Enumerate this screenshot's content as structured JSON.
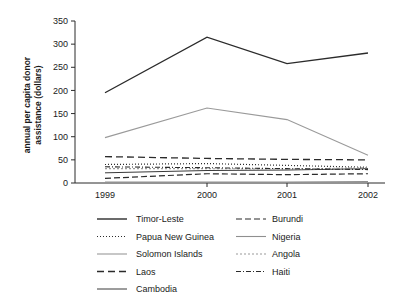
{
  "chart_data": {
    "type": "line",
    "title": "",
    "xlabel": "",
    "ylabel": "annual per capita donor assistance (dollars)",
    "ylabel_line1": "annual per capita donor",
    "ylabel_line2": "assistance (dollars)",
    "categories": [
      "1999",
      "2000",
      "2001",
      "2002"
    ],
    "x": [
      1999,
      2000,
      2001,
      2002
    ],
    "ylim": [
      0,
      350
    ],
    "yticks": [
      0,
      50,
      100,
      150,
      200,
      250,
      300,
      350
    ],
    "ytick_labels": [
      "0",
      "50",
      "100",
      "150",
      "200",
      "250",
      "300",
      "350"
    ],
    "grid": false,
    "legend_position": "bottom",
    "series": [
      {
        "name": "Timor-Leste",
        "values": [
          195,
          315,
          258,
          281
        ],
        "color": "#2b2b2b",
        "dash": "none",
        "width": 1.4
      },
      {
        "name": "Papua New Guinea",
        "values": [
          40,
          42,
          38,
          34
        ],
        "color": "#2b2b2b",
        "dash": "1,2",
        "width": 1.2
      },
      {
        "name": "Solomon Islands",
        "values": [
          98,
          162,
          137,
          60
        ],
        "color": "#9a9a9a",
        "dash": "none",
        "width": 1.1
      },
      {
        "name": "Laos",
        "values": [
          57,
          53,
          51,
          50
        ],
        "color": "#2b2b2b",
        "dash": "7,4",
        "width": 1.3
      },
      {
        "name": "Cambodia",
        "values": [
          22,
          27,
          28,
          31
        ],
        "color": "#3a3a3a",
        "dash": "none",
        "width": 1.0
      },
      {
        "name": "Burundi",
        "values": [
          10,
          20,
          18,
          20
        ],
        "color": "#2b2b2b",
        "dash": "6,3",
        "width": 1.2
      },
      {
        "name": "Nigeria",
        "values": [
          2,
          2,
          2,
          3
        ],
        "color": "#8f8f8f",
        "dash": "none",
        "width": 1.1
      },
      {
        "name": "Angola",
        "values": [
          31,
          31,
          30,
          33
        ],
        "color": "#9a9a9a",
        "dash": "2,2",
        "width": 1.1
      },
      {
        "name": "Haiti",
        "values": [
          35,
          33,
          31,
          29
        ],
        "color": "#2b2b2b",
        "dash": "5,2,1,2",
        "width": 1.1
      }
    ],
    "legend_columns": [
      [
        "Timor-Leste",
        "Papua New Guinea",
        "Solomon Islands",
        "Laos",
        "Cambodia"
      ],
      [
        "Burundi",
        "Nigeria",
        "Angola",
        "Haiti"
      ]
    ]
  }
}
